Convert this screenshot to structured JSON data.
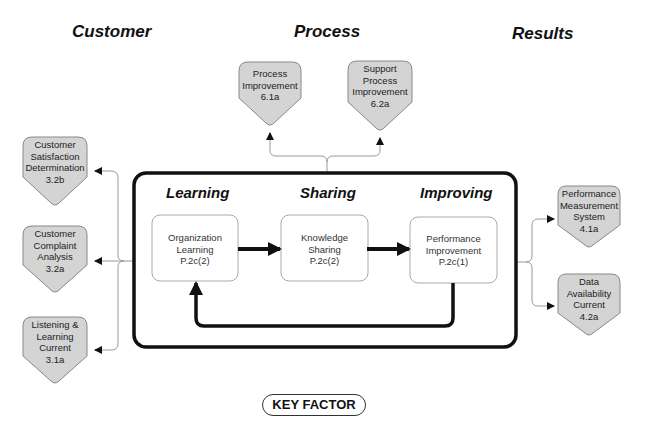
{
  "headers": {
    "customer": "Customer",
    "process": "Process",
    "results": "Results"
  },
  "stages": {
    "learning": "Learning",
    "sharing": "Sharing",
    "improving": "Improving"
  },
  "process_boxes": [
    {
      "lines": [
        "Organization",
        "Learning",
        "P.2c(2)"
      ]
    },
    {
      "lines": [
        "Knowledge",
        "Sharing",
        "P.2c(2)"
      ]
    },
    {
      "lines": [
        "Performance",
        "Improvement",
        "P.2c(1)"
      ]
    }
  ],
  "customer_nodes": [
    {
      "lines": [
        "Customer",
        "Satisfaction",
        "Determination",
        "3.2b"
      ]
    },
    {
      "lines": [
        "Customer",
        "Complaint",
        "Analysis",
        "3.2a"
      ]
    },
    {
      "lines": [
        "Listening &",
        "Learning",
        "Current",
        "3.1a"
      ]
    }
  ],
  "process_nodes": [
    {
      "lines": [
        "Process",
        "Improvement",
        "6.1a"
      ]
    },
    {
      "lines": [
        "Support",
        "Process",
        "Improvement",
        "6.2a"
      ]
    }
  ],
  "results_nodes": [
    {
      "lines": [
        "Performance",
        "Measurement",
        "System",
        "4.1a"
      ]
    },
    {
      "lines": [
        "Data",
        "Availability",
        "Current",
        "4.2a"
      ]
    }
  ],
  "key_factor": "KEY FACTOR",
  "colors": {
    "node_fill": "#d4d4d4",
    "node_stroke": "#888888",
    "frame": "#111111",
    "connector": "#999999"
  }
}
